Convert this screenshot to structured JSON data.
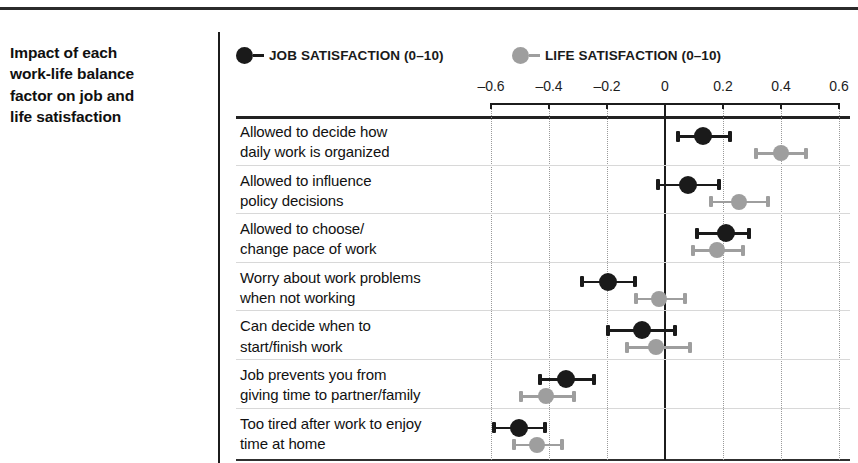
{
  "caption": {
    "lines": [
      "Impact of each",
      "work-life balance",
      "factor on job and",
      "life satisfaction"
    ]
  },
  "legend": {
    "items": [
      {
        "key": "job",
        "label": "JOB SATISFACTION (0–10)",
        "color": "#1a1a1a"
      },
      {
        "key": "life",
        "label": "LIFE SATISFACTION (0–10)",
        "color": "#9e9e9e"
      }
    ]
  },
  "colors": {
    "job": "#1a1a1a",
    "life": "#9e9e9e",
    "job_ci": "#1a1a1a",
    "life_ci": "#a8a8a8",
    "rule": "#222222",
    "grid": "#9a9a9a",
    "zero_axis": "#1c1c1c"
  },
  "chart_data": {
    "type": "scatter",
    "title": "Impact of each work-life balance factor on job and life satisfaction",
    "xlabel": "",
    "ylabel": "",
    "xlim": [
      -0.7,
      0.65
    ],
    "xticks": [
      -0.6,
      -0.4,
      -0.2,
      0,
      0.2,
      0.4,
      0.6
    ],
    "xtick_labels": [
      "–0.6",
      "–0.4",
      "–0.2",
      "0",
      "0.2",
      "0.4",
      "0.6"
    ],
    "grid": true,
    "legend_position": "top-left",
    "zero_reference_line": 0,
    "categories": [
      "Allowed to decide how\ndaily work is organized",
      "Allowed to influence\npolicy decisions",
      "Allowed to choose/\nchange pace of work",
      "Worry about work problems\nwhen not working",
      "Can decide when to\nstart/finish work",
      "Job prevents you from\ngiving time to partner/family",
      "Too tired after work to enjoy\ntime at home"
    ],
    "series": [
      {
        "name": "JOB SATISFACTION (0–10)",
        "color": "#1a1a1a",
        "values": [
          0.13,
          0.08,
          0.21,
          -0.195,
          -0.08,
          -0.34,
          -0.505
        ],
        "ci_low": [
          0.045,
          -0.025,
          0.11,
          -0.285,
          -0.195,
          -0.43,
          -0.59
        ],
        "ci_high": [
          0.225,
          0.185,
          0.29,
          -0.105,
          0.035,
          -0.245,
          -0.415
        ]
      },
      {
        "name": "LIFE SATISFACTION (0–10)",
        "color": "#9e9e9e",
        "values": [
          0.4,
          0.255,
          0.18,
          -0.02,
          -0.03,
          -0.41,
          -0.44
        ],
        "ci_low": [
          0.315,
          0.16,
          0.095,
          -0.1,
          -0.13,
          -0.495,
          -0.52
        ],
        "ci_high": [
          0.485,
          0.355,
          0.27,
          0.07,
          0.085,
          -0.315,
          -0.355
        ]
      }
    ]
  }
}
